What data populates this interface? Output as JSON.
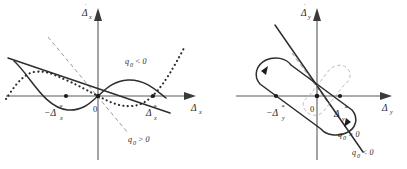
{
  "figure": {
    "background_color": "#ffffff",
    "ink_color": "#2e2e2e",
    "axis_color": "#5a5a5a",
    "width": 407,
    "height": 169,
    "panels": [
      {
        "id": "left-panel",
        "name": "phase-plane-delta-x",
        "y_axis_label": "Δ",
        "y_axis_dot": "˙",
        "y_axis_subscript": "x",
        "x_axis_label": "Δ",
        "x_axis_subscript": "x",
        "origin_label": "0",
        "equilibrium_positive": {
          "base": "Δ",
          "sub": "x",
          "sup": "*"
        },
        "equilibrium_negative": {
          "base": "−Δ",
          "sub": "x",
          "sup": "*"
        },
        "annotations": [
          {
            "name": "q0-negative-label",
            "text": "q",
            "sub": "0",
            "rel": "< 0"
          },
          {
            "name": "q0-positive-label",
            "text": "q",
            "sub": "0",
            "rel": "> 0"
          }
        ],
        "curves": [
          {
            "name": "solid-s-curve",
            "style": "solid"
          },
          {
            "name": "dotted-s-curve",
            "style": "dotted"
          },
          {
            "name": "solid-straight-line",
            "style": "solid"
          },
          {
            "name": "dashed-straight-line",
            "style": "dashed"
          }
        ]
      },
      {
        "id": "right-panel",
        "name": "phase-plane-delta-y",
        "y_axis_label": "Δ",
        "y_axis_dot": "˙",
        "y_axis_subscript": "y",
        "x_axis_label": "Δ",
        "x_axis_subscript": "y",
        "origin_label": "0",
        "equilibrium_positive": {
          "base": "Δ",
          "sub": "y",
          "sup": "*"
        },
        "equilibrium_negative": {
          "base": "−Δ",
          "sub": "y",
          "sup": "*"
        },
        "annotations": [
          {
            "name": "q0-positive-label",
            "text": "q",
            "sub": "0",
            "rel": "> 0"
          },
          {
            "name": "q0-negative-label",
            "text": "q",
            "sub": "0",
            "rel": "< 0"
          }
        ],
        "curves": [
          {
            "name": "limit-cycle-loop",
            "style": "solid"
          },
          {
            "name": "inner-ghost-loop",
            "style": "dashed"
          },
          {
            "name": "solid-diagonal-line",
            "style": "solid"
          },
          {
            "name": "dashed-diagonal-line",
            "style": "dashed"
          }
        ]
      }
    ]
  }
}
